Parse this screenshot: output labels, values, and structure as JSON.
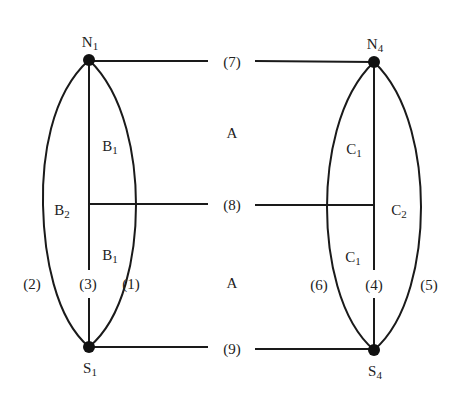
{
  "diagram": {
    "stroke_color": "#1a1a1a",
    "nodes": [
      {
        "id": "N1",
        "base": "N",
        "sub": "1",
        "x": 89,
        "y": 60
      },
      {
        "id": "S1",
        "base": "S",
        "sub": "1",
        "x": 89,
        "y": 347
      },
      {
        "id": "N4",
        "base": "N",
        "sub": "4",
        "x": 374,
        "y": 62
      },
      {
        "id": "S4",
        "base": "S",
        "sub": "4",
        "x": 374,
        "y": 350
      }
    ],
    "region_labels": {
      "left_upper": {
        "base": "B",
        "sub": "1"
      },
      "left_lower": {
        "base": "B",
        "sub": "1"
      },
      "left_outer": {
        "base": "B",
        "sub": "2"
      },
      "right_upper": {
        "base": "C",
        "sub": "1"
      },
      "right_lower": {
        "base": "C",
        "sub": "1"
      },
      "right_outer": {
        "base": "C",
        "sub": "2"
      },
      "middle_upper": "A",
      "middle_lower": "A"
    },
    "edge_labels": {
      "e1": "(1)",
      "e2": "(2)",
      "e3": "(3)",
      "e4": "(4)",
      "e5": "(5)",
      "e6": "(6)",
      "e7": "(7)",
      "e8": "(8)",
      "e9": "(9)"
    }
  }
}
